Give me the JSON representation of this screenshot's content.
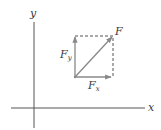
{
  "diagram": {
    "type": "vector-components",
    "axes": {
      "x_label": "x",
      "y_label": "y"
    },
    "vector": {
      "label": "F"
    },
    "components": {
      "fx": {
        "base": "F",
        "sub": "x"
      },
      "fy": {
        "base": "F",
        "sub": "y"
      }
    },
    "colors": {
      "axis": "#555555",
      "vector": "#888888",
      "dashed": "#555555",
      "text": "#3a3a3a"
    }
  }
}
